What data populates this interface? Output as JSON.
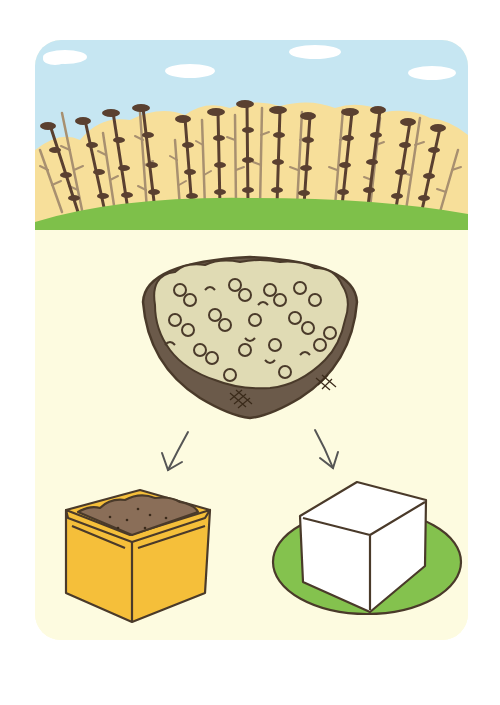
{
  "illustration": {
    "description": "Soybean field at top; a bowl of cooked soybeans in the middle; arrows pointing to miso (in a yellow container) and tofu (white block on a green plate)",
    "sections": {
      "field": {
        "label": "Soybean field",
        "sky_color": "#c6e6f2",
        "cloud_color": "#ffffff",
        "backdrop_color": "#f7df9a",
        "grass_color": "#7ec04a",
        "plant_dark": "#5a4030",
        "plant_light": "#a89070"
      },
      "bowl": {
        "label": "Cooked soybeans in bowl",
        "bowl_color": "#6b5a4a",
        "beans_bg": "#e0dbb4",
        "bean_outline": "#4a3a2a"
      },
      "arrows": [
        {
          "label": "to miso",
          "direction": "down-left"
        },
        {
          "label": "to tofu",
          "direction": "down-right"
        }
      ],
      "miso": {
        "label": "Miso",
        "container_color": "#f5bf3a",
        "paste_color": "#8a6e58"
      },
      "tofu": {
        "label": "Tofu",
        "block_color": "#ffffff",
        "plate_color": "#84c24e"
      }
    },
    "card_background": "#fdfbe0",
    "outline_color": "#4a3a2a"
  }
}
